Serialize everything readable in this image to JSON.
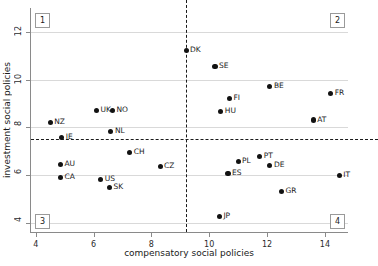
{
  "chart_data": {
    "type": "scatter",
    "title": "",
    "xlabel": "compensatory social policies",
    "ylabel": "investment social policies",
    "xlim": [
      3.8,
      14.8
    ],
    "ylim": [
      3.6,
      13.0
    ],
    "xticks": [
      4,
      6,
      8,
      10,
      12,
      14
    ],
    "yticks": [
      4,
      6,
      8,
      10,
      12
    ],
    "grid": "horizontal",
    "legend": "none",
    "reference_lines": {
      "vertical_x": 9.2,
      "horizontal_y": 7.5,
      "style": "dashed"
    },
    "quadrant_labels": [
      "1",
      "2",
      "3",
      "4"
    ],
    "points": [
      {
        "label": "DK",
        "x": 9.2,
        "y": 11.2
      },
      {
        "label": "SE",
        "x": 10.2,
        "y": 10.55
      },
      {
        "label": "BE",
        "x": 12.1,
        "y": 9.7
      },
      {
        "label": "FR",
        "x": 14.2,
        "y": 9.4
      },
      {
        "label": "FI",
        "x": 10.7,
        "y": 9.2
      },
      {
        "label": "HU",
        "x": 10.4,
        "y": 8.65
      },
      {
        "label": "UK",
        "x": 6.1,
        "y": 8.7
      },
      {
        "label": "NO",
        "x": 6.65,
        "y": 8.7
      },
      {
        "label": "AT",
        "x": 13.6,
        "y": 8.3
      },
      {
        "label": "NZ",
        "x": 4.5,
        "y": 8.2
      },
      {
        "label": "NL",
        "x": 6.6,
        "y": 7.8
      },
      {
        "label": "IE",
        "x": 4.9,
        "y": 7.55
      },
      {
        "label": "CH",
        "x": 7.25,
        "y": 6.95
      },
      {
        "label": "PT",
        "x": 11.75,
        "y": 6.75
      },
      {
        "label": "PL",
        "x": 11.0,
        "y": 6.55
      },
      {
        "label": "AU",
        "x": 4.85,
        "y": 6.45
      },
      {
        "label": "DE",
        "x": 12.1,
        "y": 6.4
      },
      {
        "label": "CZ",
        "x": 8.3,
        "y": 6.35
      },
      {
        "label": "ES",
        "x": 10.65,
        "y": 6.05
      },
      {
        "label": "IT",
        "x": 14.5,
        "y": 5.98
      },
      {
        "label": "CA",
        "x": 4.85,
        "y": 5.9
      },
      {
        "label": "US",
        "x": 6.25,
        "y": 5.8
      },
      {
        "label": "SK",
        "x": 6.55,
        "y": 5.45
      },
      {
        "label": "GR",
        "x": 12.5,
        "y": 5.3
      },
      {
        "label": "JP",
        "x": 10.35,
        "y": 4.25
      }
    ]
  }
}
